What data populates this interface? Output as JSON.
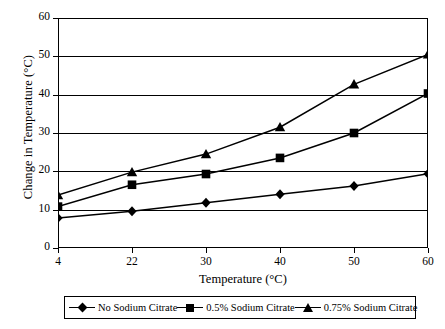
{
  "chart_data": {
    "type": "line",
    "title": "",
    "xlabel": "Temperature (°C)",
    "ylabel": "Change in Temperature (°C)",
    "categories": [
      "4",
      "22",
      "30",
      "40",
      "50",
      "60"
    ],
    "xlim": [
      0,
      5
    ],
    "ylim": [
      0,
      60
    ],
    "ytick_labels": [
      "0",
      "10",
      "20",
      "30",
      "40",
      "50",
      "60"
    ],
    "ytick_values": [
      0,
      10,
      20,
      30,
      40,
      50,
      60
    ],
    "grid": "horizontal",
    "legend_position": "bottom",
    "series": [
      {
        "name": "No Sodium Citrate",
        "marker": "diamond",
        "color": "#000000",
        "values": [
          7.8,
          9.6,
          11.8,
          14.0,
          16.2,
          19.4
        ]
      },
      {
        "name": "0.5% Sodium Citrate",
        "marker": "square",
        "color": "#000000",
        "values": [
          10.8,
          16.5,
          19.3,
          23.5,
          30.0,
          40.3
        ]
      },
      {
        "name": "0.75% Sodium Citrate",
        "marker": "triangle",
        "color": "#000000",
        "values": [
          13.8,
          19.8,
          24.5,
          31.5,
          42.7,
          50.5
        ]
      }
    ]
  },
  "axes": {
    "y_title": "Change in Temperature (°C)",
    "x_title": "Temperature (°C)"
  },
  "legend": {
    "items": [
      {
        "label": "No Sodium Citrate",
        "marker": "diamond"
      },
      {
        "label": "0.5% Sodium Citrate",
        "marker": "square"
      },
      {
        "label": "0.75% Sodium Citrate",
        "marker": "triangle"
      }
    ]
  }
}
